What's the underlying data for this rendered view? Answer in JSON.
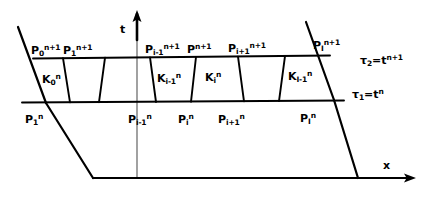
{
  "figure": {
    "type": "space-time-grid-diagram",
    "ink_color": "#000000",
    "background": "#ffffff"
  },
  "axes": {
    "vertical": {
      "label": "t",
      "arrow": "up"
    },
    "horizontal": {
      "label": "x",
      "arrow": "right"
    }
  },
  "time_levels": [
    {
      "name": "upper",
      "label_tau": "τ",
      "label_tau_sub": "2",
      "equals": "=",
      "label_t": "t",
      "label_t_sup": "n+1"
    },
    {
      "name": "lower",
      "label_tau": "τ",
      "label_tau_sub": "1",
      "equals": "=",
      "label_t": "t",
      "label_t_sup": "n"
    }
  ],
  "upper_points": [
    {
      "base": "P",
      "sub": "0",
      "sup": "n+1"
    },
    {
      "base": "P",
      "sub": "1",
      "sup": "n+1"
    },
    {
      "base": "P",
      "sub": "i-1",
      "sup": "n+1"
    },
    {
      "base": "P",
      "sub": "",
      "sup": "n+1"
    },
    {
      "base": "P",
      "sub": "i+1",
      "sup": "n+1"
    },
    {
      "base": "P",
      "sub": "I",
      "sup": "n+1"
    }
  ],
  "lower_points": [
    {
      "base": "P",
      "sub": "1",
      "sup": "n"
    },
    {
      "base": "P",
      "sub": "i-1",
      "sup": "n"
    },
    {
      "base": "P",
      "sub": "i",
      "sup": "n"
    },
    {
      "base": "P",
      "sub": "i+1",
      "sup": "n"
    },
    {
      "base": "P",
      "sub": "I",
      "sup": "n"
    }
  ],
  "cells": [
    {
      "base": "K",
      "sub": "0",
      "sup": "n"
    },
    {
      "base": "K",
      "sub": "i-1",
      "sup": "n"
    },
    {
      "base": "K",
      "sub": "i",
      "sup": "n"
    },
    {
      "base": "K",
      "sub": "I-1",
      "sup": "n"
    }
  ]
}
